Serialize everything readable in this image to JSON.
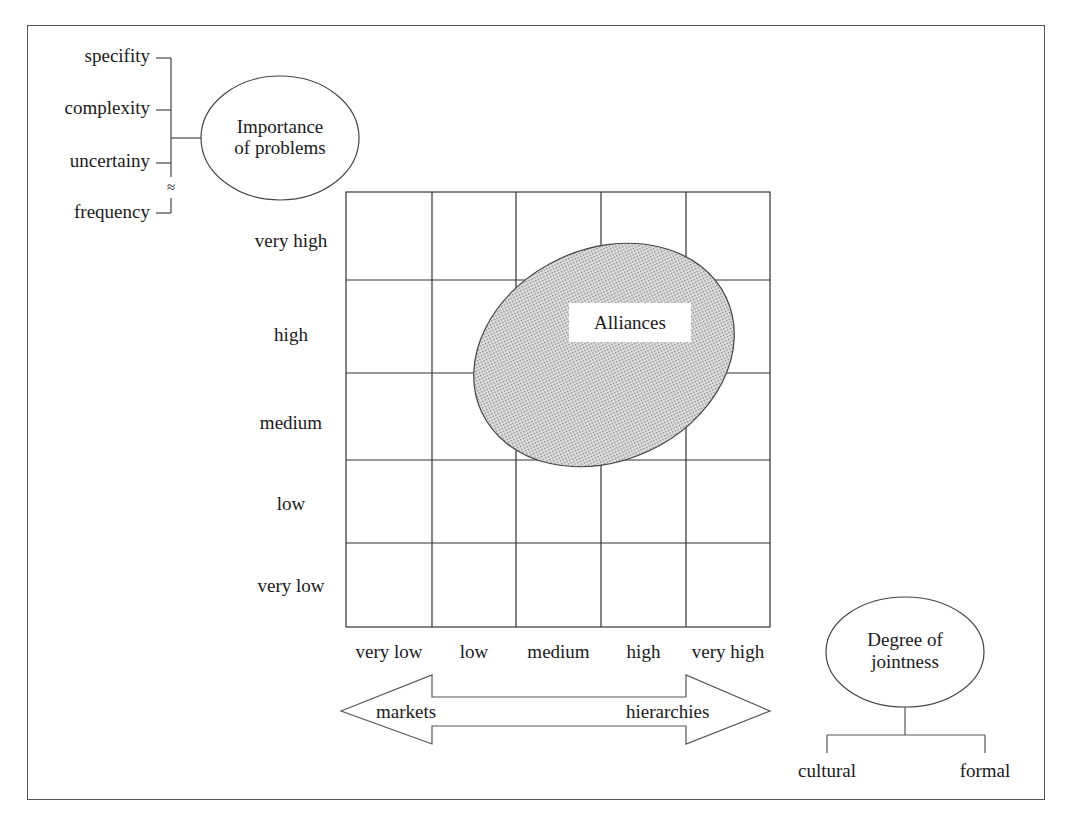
{
  "factors": {
    "items": [
      "specifity",
      "complexity",
      "uncertainy",
      "frequency"
    ],
    "approx_symbol": "≈"
  },
  "importance_node": {
    "line1": "Importance",
    "line2": "of problems"
  },
  "matrix": {
    "y_axis_labels": [
      "very high",
      "high",
      "medium",
      "low",
      "very low"
    ],
    "x_axis_labels": [
      "very low",
      "low",
      "medium",
      "high",
      "very high"
    ],
    "rows": 5,
    "cols": 5,
    "region": {
      "label": "Alliances",
      "fill": "#c8c8c8"
    }
  },
  "continuum": {
    "left": "markets",
    "right": "hierarchies"
  },
  "jointness_node": {
    "line1": "Degree of",
    "line2": "jointness",
    "children": [
      "cultural",
      "formal"
    ]
  }
}
